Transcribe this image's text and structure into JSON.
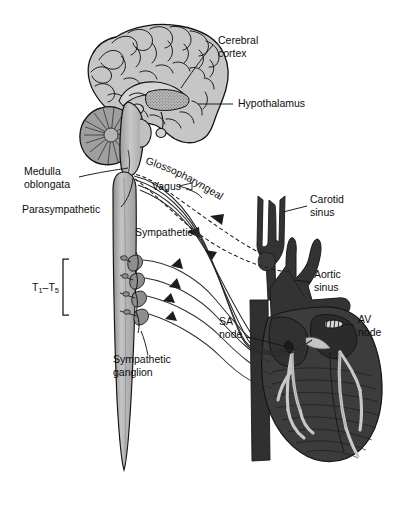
{
  "figure": {
    "background_color": "#ffffff",
    "ink_color": "#111111"
  },
  "palette": {
    "paper": "#ffffff",
    "outline": "#121212",
    "brain_gray": "#c6c6c6",
    "brain_gray_dark": "#a8a8a8",
    "cerebellum_gray": "#9a9a9a",
    "brainstem_gray": "#b4b4b4",
    "cord_gray": "#b9b9b9",
    "cord_gray_dark": "#9d9d9d",
    "ganglion_gray": "#8e8e8e",
    "heart_dark": "#3a3a3a",
    "heart_darker": "#262626",
    "vessel_dark": "#333333",
    "conduction_light": "#c9c9c9",
    "nerve_line": "#2b2b2b",
    "stipple": "#6f6f6f"
  },
  "labels": {
    "cerebral_cortex": {
      "line1": "Cerebral",
      "line2": "cortex"
    },
    "hypothalamus": {
      "line1": "Hypothalamus"
    },
    "medulla_oblongata": {
      "line1": "Medulla",
      "line2": "oblongata"
    },
    "parasympathetic": {
      "line1": "Parasympathetic"
    },
    "glossopharyngeal": {
      "line1": "Glossopharyngeal"
    },
    "vagus": {
      "line1": "Vagus"
    },
    "sympathetic": {
      "line1": "Sympathetic"
    },
    "sympathetic_ganglion": {
      "line1": "Sympathetic",
      "line2": "ganglion"
    },
    "spinal_levels": {
      "prefix": "T",
      "sub1": "1",
      "dash": "–",
      "prefix2": "T",
      "sub2": "5",
      "full": "T1–T5"
    },
    "carotid_sinus": {
      "line1": "Carotid",
      "line2": "sinus"
    },
    "aortic_sinus": {
      "line1": "Aortic",
      "line2": "sinus"
    },
    "sa_node": {
      "line1": "SA",
      "line2": "node"
    },
    "av_node": {
      "line1": "AV",
      "line2": "node"
    }
  },
  "structures": {
    "brain": "mid-sagittal-brain-section",
    "cerebellum": "cerebellum",
    "brainstem": "brainstem",
    "spinal_cord": "spinal-cord",
    "heart": "heart",
    "aorta": "aortic-arch",
    "carotid": "common-carotid-artery",
    "ganglia_count": 4,
    "conduction_system": "purkinje-fibers"
  },
  "nerve_pathways": [
    {
      "name": "glossopharyngeal",
      "style": "dashed",
      "direction": "afferent",
      "from": "carotid-sinus",
      "to": "medulla-oblongata"
    },
    {
      "name": "aortic-afferent",
      "style": "dashed",
      "direction": "afferent",
      "from": "aortic-sinus",
      "to": "medulla-oblongata"
    },
    {
      "name": "vagus",
      "style": "solid",
      "direction": "efferent",
      "from": "medulla-oblongata",
      "to": "sa-av-node"
    },
    {
      "name": "sympathetic",
      "style": "solid",
      "direction": "efferent",
      "from": "spinal-cord-T1-T5",
      "to": "heart"
    }
  ]
}
